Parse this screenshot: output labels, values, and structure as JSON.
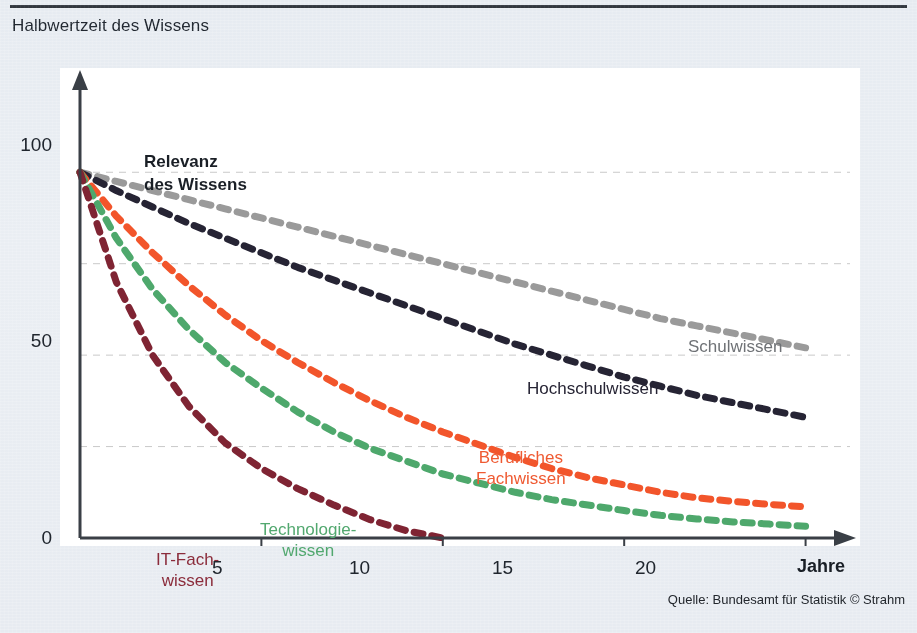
{
  "header": {
    "title": "Halbwertzeit des Wissens"
  },
  "footer": {
    "source": "Quelle: Bundesamt für Statistik © Strahm"
  },
  "axes": {
    "y_title": "Relevanz\ndes Wissens",
    "x_title": "Jahre",
    "y_ticks": [
      "100",
      "50",
      "0"
    ],
    "x_ticks": [
      "5",
      "10",
      "15",
      "20"
    ]
  },
  "colors": {
    "background": "#e9edf2",
    "plot_background": "#ffffff",
    "axis": "#3a3f46",
    "gridline": "#c9c9c9",
    "schulwissen": "#9a9a9a",
    "hochschulwissen": "#262434",
    "berufliches_fachwissen": "#f2552b",
    "technologiewissen": "#4ea86c",
    "it_fachwissen": "#7f2433"
  },
  "labels": {
    "schulwissen": "Schulwissen",
    "hochschulwissen": "Hochschulwissen",
    "berufliches_fachwissen": "Berufliches\nFachwissen",
    "technologiewissen": "Technologie-\nwissen",
    "it_fachwissen": "IT-Fach-\nwissen"
  },
  "chart_data": {
    "type": "line",
    "title": "Halbwertzeit des Wissens",
    "xlabel": "Jahre",
    "ylabel": "Relevanz des Wissens",
    "xlim": [
      0,
      21.5
    ],
    "ylim": [
      0,
      108
    ],
    "x_ticks": [
      5,
      10,
      15,
      20
    ],
    "y_ticks": [
      0,
      50,
      100
    ],
    "gridlines_y": [
      25,
      50,
      75,
      100
    ],
    "grid": true,
    "legend": "inline-annotations",
    "line_style": "dashed",
    "x": [
      0,
      1,
      2,
      3,
      4,
      5,
      6,
      7,
      8,
      9,
      10,
      11,
      12,
      13,
      14,
      15,
      16,
      17,
      18,
      19,
      20
    ],
    "series": [
      {
        "name": "Schulwissen",
        "color": "#9a9a9a",
        "values": [
          100,
          97.5,
          95,
          92.5,
          90,
          87.5,
          85,
          82.5,
          80,
          77.5,
          75,
          72.5,
          70,
          67.5,
          65,
          62.5,
          60,
          58,
          56,
          54,
          52
        ]
      },
      {
        "name": "Hochschulwissen",
        "color": "#262434",
        "values": [
          100,
          95,
          90.5,
          86,
          82,
          78,
          74,
          70.5,
          67,
          63.5,
          60,
          56.5,
          53,
          50,
          47,
          44,
          41.5,
          39,
          37,
          35,
          33
        ]
      },
      {
        "name": "Berufliches Fachwissen",
        "color": "#f2552b",
        "values": [
          100,
          88,
          78,
          69,
          61,
          54,
          48,
          42.5,
          37.5,
          33,
          29,
          25.5,
          22,
          19,
          16.5,
          14.5,
          12.5,
          11,
          10,
          9.2,
          8.5
        ]
      },
      {
        "name": "Technologiewissen",
        "color": "#4ea86c",
        "values": [
          100,
          82,
          68,
          57,
          48,
          41,
          34.5,
          29,
          24.5,
          21,
          17.5,
          15,
          12.5,
          10.5,
          9,
          7.5,
          6.2,
          5.2,
          4.4,
          3.8,
          3.2
        ]
      },
      {
        "name": "IT-Fachwissen",
        "color": "#7f2433",
        "values": [
          100,
          70,
          50,
          36,
          26,
          19,
          13.5,
          9,
          5,
          2,
          0,
          0,
          0,
          0,
          0,
          0,
          0,
          0,
          0,
          0,
          0
        ]
      }
    ]
  }
}
